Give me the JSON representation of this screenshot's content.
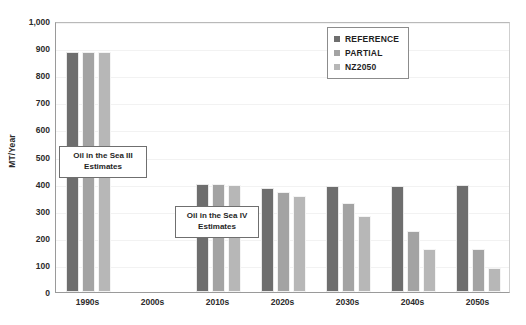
{
  "chart_data": {
    "type": "bar",
    "title": "",
    "xlabel": "",
    "ylabel": "MT/Year",
    "ylim": [
      0,
      1000
    ],
    "ytick_labels": [
      "1,000",
      "900",
      "800",
      "700",
      "600",
      "500",
      "400",
      "300",
      "200",
      "100",
      "0"
    ],
    "ytick_values": [
      1000,
      900,
      800,
      700,
      600,
      500,
      400,
      300,
      200,
      100,
      0
    ],
    "grid": true,
    "legend_position": "top-right",
    "categories": [
      "1990s",
      "2000s",
      "2010s",
      "2020s",
      "2030s",
      "2040s",
      "2050s"
    ],
    "series": [
      {
        "name": "REFERENCE",
        "color": "#6e6e6e",
        "values": [
          885,
          null,
          398,
          385,
          390,
          390,
          395
        ]
      },
      {
        "name": "PARTIAL",
        "color": "#a3a3a3",
        "values": [
          885,
          null,
          398,
          370,
          330,
          225,
          160
        ]
      },
      {
        "name": "NZ2050",
        "color": "#b7b7b7",
        "values": [
          885,
          null,
          395,
          355,
          280,
          160,
          90
        ]
      }
    ],
    "annotations": [
      {
        "id": "oil-in-the-sea-3",
        "line1": "Oil in the Sea III",
        "line2": "Estimates"
      },
      {
        "id": "oil-in-the-sea-4",
        "line1": "Oil in the Sea IV",
        "line2": "Estimates"
      }
    ]
  },
  "colors": {
    "reference": "#6e6e6e",
    "partial": "#a3a3a3",
    "nz2050": "#b7b7b7",
    "axis": "#9a9a9a",
    "grid": "#f2f2f2",
    "text": "#2b2b2b"
  }
}
